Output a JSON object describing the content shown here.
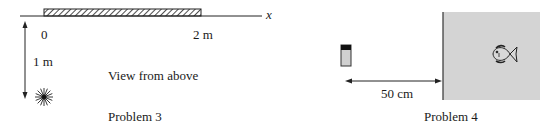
{
  "problem3": {
    "caption": "Problem 3",
    "view_label": "View from above",
    "axis_label": "x",
    "tick_start": "0",
    "tick_end": "2 m",
    "distance_label": "1 m",
    "icons": {
      "light_source": "star-burst-icon"
    }
  },
  "problem4": {
    "caption": "Problem 4",
    "distance_label": "50 cm",
    "icons": {
      "object": "small-object-icon",
      "fish": "fish-icon"
    },
    "colors": {
      "water": "#d4d4d4",
      "tank_wall": "#333333"
    }
  }
}
